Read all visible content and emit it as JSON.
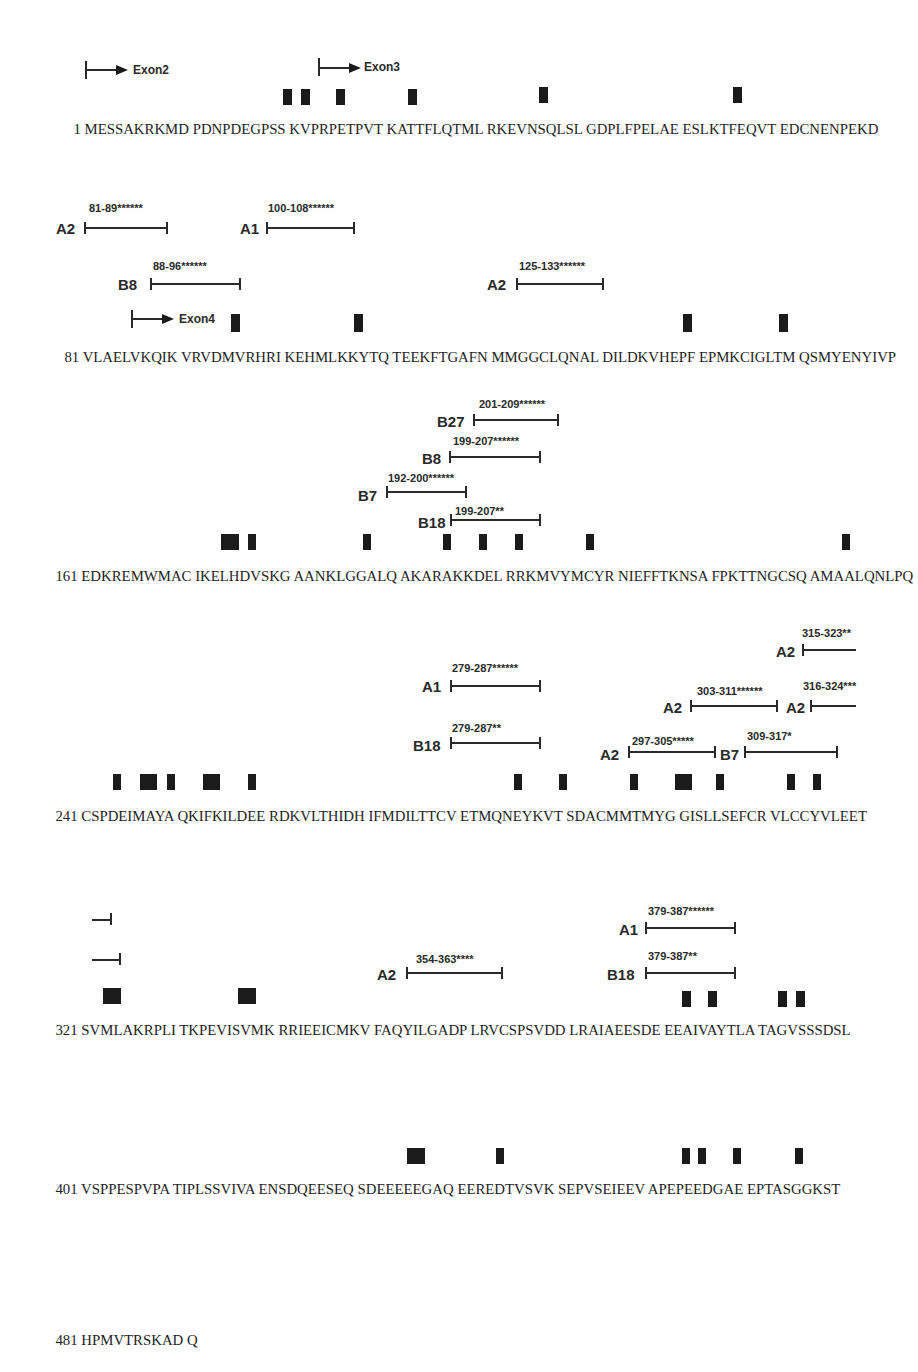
{
  "figure": {
    "type": "protein sequence epitope map",
    "exons": [
      {
        "label": "Exon2",
        "row": 0
      },
      {
        "label": "Exon3",
        "row": 0
      },
      {
        "label": "Exon4",
        "row": 1
      }
    ],
    "rows": [
      {
        "start": "1",
        "blocks": [
          "MESSAKRKMD",
          "PDNPDEGPSS",
          "KVPRPETPVT",
          "KATTFLQTML",
          "RKEVNSQLSL",
          "GDPLFPELAE",
          "ESLKTFEQVT",
          "EDCNENPEKD"
        ]
      },
      {
        "start": "81",
        "blocks": [
          "VLAELVKQIK",
          "VRVDMVRHRI",
          "KEHMLKKYTQ",
          "TEEKFTGAFN",
          "MMGGCLQNAL",
          "DILDKVHEPF",
          "EPMKCIGLTM",
          "QSMYENYIVP"
        ]
      },
      {
        "start": "161",
        "blocks": [
          "EDKREMWMAC",
          "IKELHDVSKG",
          "AANKLGGALQ",
          "AKARAKKDEL",
          "RRKMVYMCYR",
          "NIEFFTKNSA",
          "FPKTTNGCSQ",
          "AMAALQNLPQ"
        ]
      },
      {
        "start": "241",
        "blocks": [
          "CSPDEIMAYA",
          "QKIFKILDEE",
          "RDKVLTHIDH",
          "IFMDILTTCV",
          "ETMQNEYKVT",
          "SDACMMTMYG",
          "GISLLSEFCR",
          "VLCCYVLEET"
        ]
      },
      {
        "start": "321",
        "blocks": [
          "SVMLAKRPLI",
          "TKPEVISVMK",
          "RRIEEICMKV",
          "FAQYILGADP",
          "LRVCSPSVDD",
          "LRAIAEESDE",
          "EEAIVAYTLA",
          "TAGVSSSDSL"
        ]
      },
      {
        "start": "401",
        "blocks": [
          "VSPPESPVPA",
          "TIPLSSVIVA",
          "ENSDQEESEQ",
          "SDEEEEEGAQ",
          "EEREDTVSVK",
          "SEPVSEIEEV",
          "APEPEEDGAE",
          "EPTASGGKST"
        ]
      },
      {
        "start": "481",
        "blocks": [
          "HPMVTRSKAD",
          "Q"
        ]
      }
    ],
    "epitopes": [
      {
        "allele": "A2",
        "range": "81-89******"
      },
      {
        "allele": "A1",
        "range": "100-108******"
      },
      {
        "allele": "B8",
        "range": "88-96******"
      },
      {
        "allele": "A2",
        "range": "125-133******"
      },
      {
        "allele": "B27",
        "range": "201-209******"
      },
      {
        "allele": "B8",
        "range": "199-207******"
      },
      {
        "allele": "B7",
        "range": "192-200******"
      },
      {
        "allele": "B18",
        "range": "199-207**"
      },
      {
        "allele": "A2",
        "range": "315-323**"
      },
      {
        "allele": "A1",
        "range": "279-287******"
      },
      {
        "allele": "A2",
        "range": "303-311******"
      },
      {
        "allele": "A2",
        "range": "316-324***"
      },
      {
        "allele": "B18",
        "range": "279-287**"
      },
      {
        "allele": "A2",
        "range": "297-305*****"
      },
      {
        "allele": "B7",
        "range": "309-317*"
      },
      {
        "allele": "A2",
        "range": "354-363****"
      },
      {
        "allele": "A1",
        "range": "379-387******"
      },
      {
        "allele": "B18",
        "range": "379-387**"
      }
    ],
    "colors": {
      "text": "#1e1e1e",
      "marker": "#1b1b1b",
      "background": "#ffffff"
    }
  }
}
